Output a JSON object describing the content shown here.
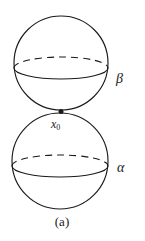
{
  "figure": {
    "caption": "(a)",
    "stroke_color": "#1a1a1a",
    "background_color": "#ffffff",
    "labels": {
      "upper_sphere": "β",
      "lower_sphere": "α",
      "tangency_point_base": "x",
      "tangency_point_subscript": "0"
    },
    "geometry": {
      "upper_sphere": {
        "cx": 61,
        "cy": 63,
        "r": 47
      },
      "lower_sphere": {
        "cx": 60,
        "cy": 161,
        "r": 48
      },
      "upper_equator": {
        "cx": 61,
        "cy": 68,
        "rx": 47,
        "ry": 11
      },
      "lower_equator": {
        "cx": 60,
        "cy": 166,
        "rx": 48,
        "ry": 11
      },
      "tangency_point": {
        "x": 61,
        "y": 111,
        "r": 2.4
      }
    }
  }
}
